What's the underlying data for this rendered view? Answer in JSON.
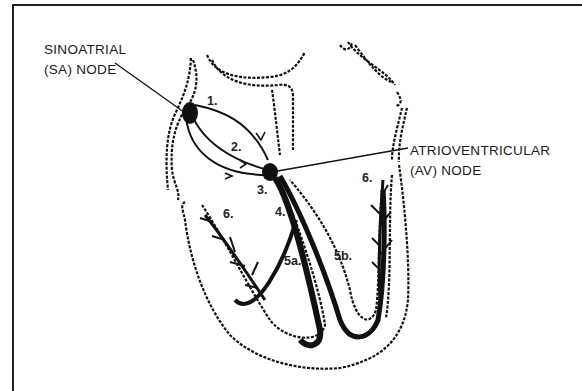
{
  "diagram": {
    "labels": {
      "sa_node_line1": "SINOATRIAL",
      "sa_node_line2": "(SA) NODE",
      "av_node_line1": "ATRIOVENTRICULAR",
      "av_node_line2": "(AV) NODE"
    },
    "step_numbers": {
      "n1": "1.",
      "n2": "2.",
      "n3": "3.",
      "n4": "4.",
      "n5a": "5a.",
      "n5b": "5b.",
      "n6_left": "6.",
      "n6_right": "6."
    },
    "colors": {
      "ink": "#111111",
      "background": "#ffffff"
    }
  }
}
